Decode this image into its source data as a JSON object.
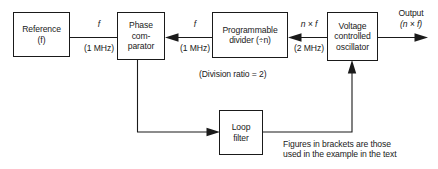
{
  "diagram": {
    "stroke_color": "#1a1a1a",
    "background_color": "#ffffff",
    "blocks": [
      {
        "id": "reference",
        "label": "Reference\n(f)"
      },
      {
        "id": "phase_comparator",
        "label": "Phase\ncom-\nparator"
      },
      {
        "id": "programmable_divider",
        "label": "Programmable\ndivider (÷n)"
      },
      {
        "id": "vco",
        "label": "Voltage\ncontrolled\noscillator"
      },
      {
        "id": "loop_filter",
        "label": "Loop\nfilter"
      }
    ],
    "signal_labels": [
      {
        "id": "ref_to_pc_signal",
        "text": "f"
      },
      {
        "id": "ref_to_pc_freq",
        "text": "(1 MHz)"
      },
      {
        "id": "div_to_pc_signal",
        "text": "f"
      },
      {
        "id": "div_to_pc_freq",
        "text": "(1 MHz)"
      },
      {
        "id": "vco_to_div_signal",
        "text": "n × f"
      },
      {
        "id": "vco_to_div_freq",
        "text": "(2 MHz)"
      },
      {
        "id": "output_label",
        "text": "Output"
      },
      {
        "id": "output_signal",
        "text": "(n × f)"
      }
    ],
    "annotations": [
      {
        "id": "division_ratio_note",
        "text": "(Division ratio = 2)"
      },
      {
        "id": "brackets_note",
        "text": "Figures  in  brackets are those\nused in the example in the text"
      }
    ]
  }
}
